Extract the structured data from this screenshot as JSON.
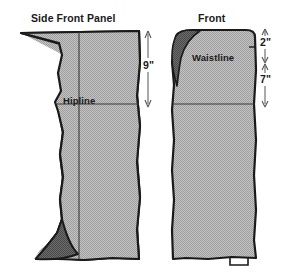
{
  "figure": {
    "kind": "sewing-pattern-diagram",
    "background_color": "#ffffff",
    "fabric_fill_color": "#b3b3b3",
    "fold_fill_color": "#5a5a5a",
    "outline_color": "#1a1a1a",
    "text_color": "#1a1a1a"
  },
  "panels": {
    "left": {
      "title": "Side Front Panel",
      "inner_label": "Hipline"
    },
    "right": {
      "title": "Front",
      "inner_label": "Waistline"
    }
  },
  "dimensions": [
    {
      "id": "left-vertical",
      "value": "9\"",
      "applies_to": "Side Front Panel",
      "span": "top edge to Hipline"
    },
    {
      "id": "right-upper",
      "value": "2\"",
      "applies_to": "Front",
      "span": "top edge to Waistline"
    },
    {
      "id": "right-lower",
      "value": "7\"",
      "applies_to": "Front",
      "span": "Waistline to Hipline"
    }
  ],
  "icons": {
    "arrow_up": "arrow-up-icon",
    "arrow_down": "arrow-down-icon"
  }
}
